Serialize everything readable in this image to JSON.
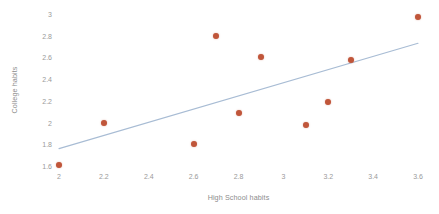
{
  "chart_data": {
    "type": "scatter",
    "title": "",
    "xlabel": "High School habits",
    "ylabel": "College habits",
    "xlim": [
      2.0,
      3.6
    ],
    "ylim": [
      1.6,
      3.0
    ],
    "xticks": [
      "2",
      "2.2",
      "2.4",
      "2.6",
      "2.8",
      "3",
      "3.2",
      "3.4",
      "3.6"
    ],
    "xtick_values": [
      2.0,
      2.2,
      2.4,
      2.6,
      2.8,
      3.0,
      3.2,
      3.4,
      3.6
    ],
    "yticks": [
      "1.6",
      "1.8",
      "2",
      "2.2",
      "2.4",
      "2.6",
      "2.8",
      "3"
    ],
    "ytick_values": [
      1.6,
      1.8,
      2.0,
      2.2,
      2.4,
      2.6,
      2.8,
      3.0
    ],
    "grid": false,
    "legend": "none",
    "series": [
      {
        "name": "observations",
        "marker_color": "#c0563a",
        "points": [
          {
            "x": 2.0,
            "y": 1.61
          },
          {
            "x": 2.2,
            "y": 2.0
          },
          {
            "x": 2.6,
            "y": 1.8
          },
          {
            "x": 2.7,
            "y": 2.8
          },
          {
            "x": 2.8,
            "y": 2.09
          },
          {
            "x": 2.9,
            "y": 2.6
          },
          {
            "x": 3.1,
            "y": 1.98
          },
          {
            "x": 3.2,
            "y": 2.19
          },
          {
            "x": 3.3,
            "y": 2.58
          },
          {
            "x": 3.6,
            "y": 2.97
          }
        ]
      }
    ],
    "trendline": {
      "name": "linear-fit",
      "color": "#a8bcd4",
      "x_start": 2.0,
      "y_start": 1.76,
      "x_end": 3.6,
      "y_end": 2.73
    }
  },
  "caption": {
    "partial_text": ""
  }
}
